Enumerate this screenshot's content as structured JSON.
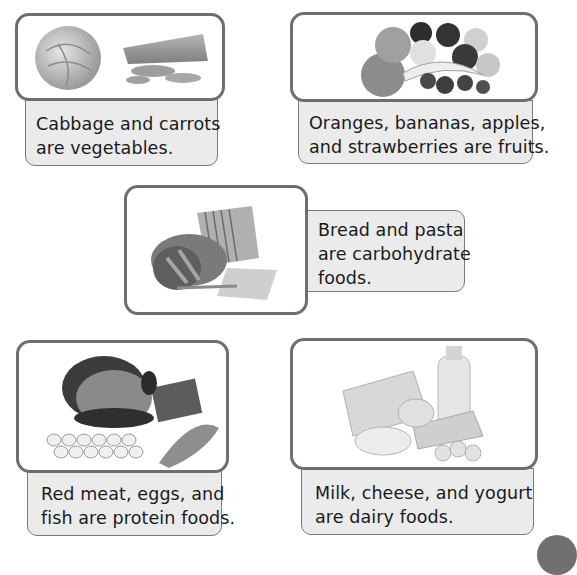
{
  "panels": [
    {
      "id": "vegetables",
      "image_alt": "cabbage and carrots",
      "caption_lines": [
        "Cabbage and carrots",
        "are vegetables."
      ]
    },
    {
      "id": "fruits",
      "image_alt": "oranges, bananas, apples and strawberries",
      "caption_lines": [
        "Oranges, bananas, apples,",
        "and strawberries are fruits."
      ]
    },
    {
      "id": "carbohydrates",
      "image_alt": "bread and pasta",
      "caption_lines": [
        "Bread and pasta",
        "are carbohydrate",
        "foods."
      ]
    },
    {
      "id": "protein",
      "image_alt": "red meat, eggs and fish",
      "caption_lines": [
        "Red meat, eggs, and",
        "fish are protein foods."
      ]
    },
    {
      "id": "dairy",
      "image_alt": "milk, cheese and yogurt",
      "caption_lines": [
        "Milk, cheese, and yogurt",
        "are dairy foods."
      ]
    }
  ],
  "colors": {
    "frame_border": "#6e6e6e",
    "caption_bg": "#ebebeb",
    "page_tab": "#707070"
  }
}
